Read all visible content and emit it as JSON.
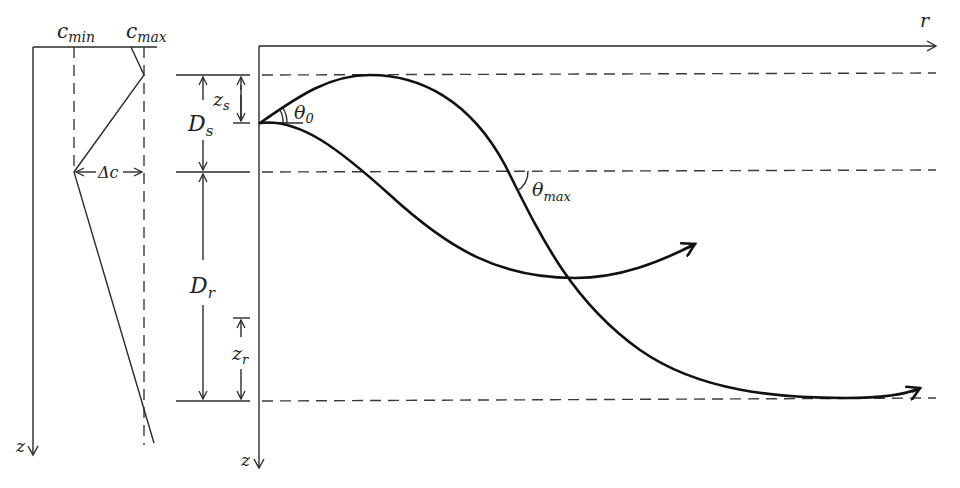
{
  "figure": {
    "profile_panel": {
      "c_min_label": {
        "base": "c",
        "sub": "min"
      },
      "c_max_label": {
        "base": "c",
        "sub": "max"
      },
      "delta_c_label": "Δc",
      "depth_axis_label": "z"
    },
    "ray_panel": {
      "range_axis_label": "r",
      "depth_axis_label": "z",
      "source_depth_label": {
        "base": "z",
        "sub": "s"
      },
      "source_layer_label": {
        "base": "D",
        "sub": "s"
      },
      "receiver_layer_label": {
        "base": "D",
        "sub": "r"
      },
      "receiver_depth_label": {
        "base": "z",
        "sub": "r"
      },
      "launch_angle_label": {
        "base": "θ",
        "sub": "0"
      },
      "max_angle_label": {
        "base": "θ",
        "sub": "max"
      }
    }
  }
}
